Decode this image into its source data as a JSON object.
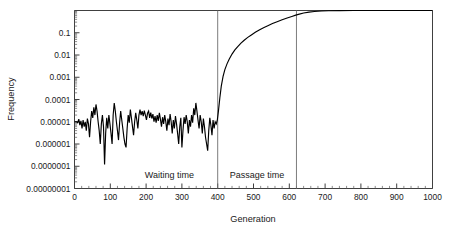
{
  "chart_data": {
    "type": "line",
    "title": "",
    "xlabel": "Generation",
    "ylabel": "Frequency",
    "xlim": [
      0,
      1000
    ],
    "ylim": [
      1e-08,
      1
    ],
    "yscale": "log",
    "xscale": "linear",
    "grid": false,
    "legend": null,
    "xticks": [
      0,
      100,
      200,
      300,
      400,
      500,
      600,
      700,
      800,
      900,
      1000
    ],
    "xtick_labels": [
      "0",
      "100",
      "200",
      "300",
      "400",
      "500",
      "600",
      "700",
      "800",
      "900",
      "1000"
    ],
    "yticks": [
      0.1,
      0.01,
      0.001,
      0.0001,
      1e-05,
      1e-06,
      1e-07,
      1e-08
    ],
    "ytick_labels": [
      "0.1",
      "0.01",
      "0.001",
      "0.0001",
      "0.00001",
      "0.000001",
      "0.0000001",
      "0.00000001"
    ],
    "annotations": [
      {
        "text": "Waiting time",
        "x": 265,
        "y": 3e-08
      },
      {
        "text": "Passage time",
        "x": 510,
        "y": 3e-08
      }
    ],
    "vlines": [
      400,
      620
    ],
    "series": [
      {
        "name": "allele frequency",
        "color": "#000000",
        "x": [
          0,
          3,
          6,
          9,
          12,
          15,
          18,
          21,
          24,
          27,
          30,
          33,
          36,
          39,
          42,
          45,
          48,
          51,
          54,
          57,
          60,
          63,
          66,
          69,
          72,
          75,
          78,
          81,
          84,
          87,
          90,
          93,
          96,
          99,
          102,
          105,
          108,
          111,
          114,
          117,
          120,
          123,
          126,
          129,
          132,
          135,
          138,
          141,
          144,
          147,
          150,
          153,
          156,
          159,
          162,
          165,
          168,
          171,
          174,
          177,
          180,
          183,
          186,
          189,
          192,
          195,
          198,
          201,
          204,
          207,
          210,
          213,
          216,
          219,
          222,
          225,
          228,
          231,
          234,
          237,
          240,
          243,
          246,
          249,
          252,
          255,
          258,
          261,
          264,
          267,
          270,
          273,
          276,
          279,
          282,
          285,
          288,
          291,
          294,
          297,
          300,
          303,
          306,
          309,
          312,
          315,
          318,
          321,
          324,
          327,
          330,
          333,
          336,
          339,
          342,
          345,
          348,
          351,
          354,
          357,
          360,
          363,
          366,
          369,
          372,
          375,
          378,
          381,
          384,
          387,
          390,
          393,
          396,
          399,
          402,
          406,
          410,
          415,
          420,
          426,
          432,
          440,
          448,
          456,
          465,
          474,
          484,
          494,
          505,
          516,
          528,
          540,
          553,
          566,
          580,
          594,
          607,
          618,
          628,
          640,
          655,
          670,
          690,
          710,
          740,
          780,
          830,
          890,
          950,
          1000
        ],
        "y": [
          1e-05,
          1e-05,
          1e-05,
          9e-06,
          1.3e-05,
          7e-06,
          1.1e-05,
          5e-06,
          1.2e-05,
          6e-06,
          1e-05,
          4e-06,
          1.4e-05,
          8e-06,
          2e-06,
          1e-05,
          3e-05,
          1.5e-05,
          4.5e-05,
          2e-05,
          6e-05,
          3e-05,
          1e-05,
          4e-06,
          1e-06,
          8e-06,
          2e-05,
          6e-06,
          1.2e-07,
          3e-06,
          1.5e-05,
          5e-06,
          2e-05,
          8e-06,
          3e-06,
          1e-06,
          2e-05,
          7e-05,
          3e-05,
          1e-05,
          4e-06,
          1.5e-06,
          9e-06,
          3e-05,
          1.2e-05,
          5e-06,
          2e-06,
          1e-06,
          7e-07,
          5e-06,
          2e-05,
          9e-06,
          3.5e-05,
          1.5e-05,
          6e-06,
          2.5e-06,
          1e-05,
          2.5e-05,
          1.2e-05,
          5e-06,
          2e-05,
          3.5e-05,
          2e-05,
          3e-05,
          1.8e-05,
          3.2e-05,
          2e-05,
          1.2e-05,
          2.4e-05,
          3e-05,
          1.5e-05,
          2.6e-05,
          1.4e-05,
          2.2e-05,
          1e-05,
          1.8e-05,
          9e-06,
          2e-05,
          1.1e-05,
          2.5e-05,
          1.3e-05,
          6e-06,
          1.6e-05,
          8e-06,
          2e-05,
          1e-05,
          4e-06,
          1.4e-05,
          7e-06,
          2.2e-05,
          1e-05,
          3e-06,
          1.2e-05,
          5e-06,
          1.8e-05,
          8e-06,
          3e-06,
          1e-06,
          6e-06,
          1.5e-05,
          7e-07,
          4e-06,
          1.6e-05,
          8e-06,
          2e-05,
          1e-05,
          3e-06,
          1.2e-05,
          6e-06,
          2e-05,
          9e-06,
          4e-05,
          2e-05,
          7e-05,
          3e-05,
          1.2e-05,
          5e-06,
          2e-05,
          1e-05,
          3e-06,
          1.4e-05,
          6e-06,
          2e-06,
          1e-06,
          5e-07,
          4e-06,
          1.5e-05,
          7e-06,
          2.5e-06,
          1.2e-05,
          5e-06,
          1e-05,
          8e-06,
          1.2e-05,
          3e-05,
          0.00012,
          0.0004,
          0.0011,
          0.0022,
          0.004,
          0.0065,
          0.011,
          0.017,
          0.024,
          0.034,
          0.046,
          0.062,
          0.08,
          0.105,
          0.132,
          0.168,
          0.208,
          0.26,
          0.315,
          0.385,
          0.46,
          0.54,
          0.62,
          0.69,
          0.77,
          0.85,
          0.9,
          0.95,
          0.975,
          0.99,
          0.997,
          1.0,
          1.0,
          1.0,
          1.0
        ]
      }
    ]
  },
  "axis_titles": {
    "x": "Generation",
    "y": "Frequency"
  }
}
